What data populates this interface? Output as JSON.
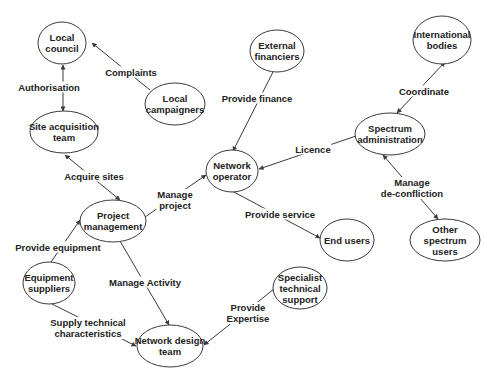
{
  "diagram": {
    "type": "stakeholder-relationship",
    "nodes": [
      {
        "id": "local_council",
        "label": "Local\ncouncil",
        "cx": 62,
        "cy": 43,
        "rx": 24,
        "ry": 21
      },
      {
        "id": "local_campaigners",
        "label": "Local\ncampaigners",
        "cx": 175,
        "cy": 104,
        "rx": 30,
        "ry": 21
      },
      {
        "id": "site_acquisition_team",
        "label": "Site acquisition\nteam",
        "cx": 64,
        "cy": 132,
        "rx": 34,
        "ry": 21
      },
      {
        "id": "external_financiers",
        "label": "External\nfinanciers",
        "cx": 277,
        "cy": 51,
        "rx": 27,
        "ry": 21
      },
      {
        "id": "international_bodies",
        "label": "International\nbodies",
        "cx": 442,
        "cy": 40,
        "rx": 29,
        "ry": 24
      },
      {
        "id": "spectrum_administration",
        "label": "Spectrum\nadministration",
        "cx": 390,
        "cy": 134,
        "rx": 35,
        "ry": 21
      },
      {
        "id": "network_operator",
        "label": "Network\noperator",
        "cx": 232,
        "cy": 171,
        "rx": 26,
        "ry": 21
      },
      {
        "id": "project_management",
        "label": "Project\nmanagement",
        "cx": 113,
        "cy": 221,
        "rx": 33,
        "ry": 21
      },
      {
        "id": "end_users",
        "label": "End users",
        "cx": 347,
        "cy": 240,
        "rx": 27,
        "ry": 21
      },
      {
        "id": "other_spectrum_users",
        "label": "Other spectrum\nusers",
        "cx": 445,
        "cy": 240,
        "rx": 35,
        "ry": 21
      },
      {
        "id": "equipment_suppliers",
        "label": "Equipment\nsuppliers",
        "cx": 49,
        "cy": 283,
        "rx": 26,
        "ry": 21
      },
      {
        "id": "specialist_technical_support",
        "label": "Specialist\ntechnical\nsupport",
        "cx": 300,
        "cy": 288,
        "rx": 27,
        "ry": 21
      },
      {
        "id": "network_design_team",
        "label": "Network design\nteam",
        "cx": 170,
        "cy": 346,
        "rx": 33,
        "ry": 21
      }
    ],
    "edges": [
      {
        "id": "complaints",
        "from": "local_campaigners",
        "to": "local_council",
        "label": "Complaints",
        "lx": 131,
        "ly": 72,
        "x1": 150,
        "y1": 90,
        "x2": 92,
        "y2": 43
      },
      {
        "id": "authorisation",
        "from": "local_council",
        "to": "site_acquisition_team",
        "label": "Authorisation",
        "lx": 49,
        "ly": 87,
        "x1": 63,
        "y1": 65,
        "x2": 63,
        "y2": 111,
        "bidirectional": true
      },
      {
        "id": "acquire_sites",
        "from": "project_management",
        "to": "site_acquisition_team",
        "label": "Acquire sites",
        "lx": 94,
        "ly": 176,
        "x1": 120,
        "y1": 200,
        "x2": 65,
        "y2": 155,
        "bidirectional": true
      },
      {
        "id": "manage_project",
        "from": "project_management",
        "to": "network_operator",
        "label": "Manage\nproject",
        "lx": 175,
        "ly": 200,
        "x1": 145,
        "y1": 217,
        "x2": 206,
        "y2": 175
      },
      {
        "id": "provide_finance",
        "from": "external_financiers",
        "to": "network_operator",
        "label": "Provide finance",
        "lx": 257,
        "ly": 98,
        "x1": 273,
        "y1": 72,
        "x2": 233,
        "y2": 151
      },
      {
        "id": "licence",
        "from": "spectrum_administration",
        "to": "network_operator",
        "label": "Licence",
        "lx": 313,
        "ly": 149,
        "x1": 356,
        "y1": 136,
        "x2": 259,
        "y2": 169
      },
      {
        "id": "coordinate",
        "from": "spectrum_administration",
        "to": "international_bodies",
        "label": "Coordinate",
        "lx": 424,
        "ly": 91,
        "x1": 397,
        "y1": 113,
        "x2": 445,
        "y2": 62,
        "bidirectional": true
      },
      {
        "id": "manage_deconfliction",
        "from": "spectrum_administration",
        "to": "other_spectrum_users",
        "label": "Manage\nde-confliction",
        "lx": 412,
        "ly": 188,
        "x1": 383,
        "y1": 155,
        "x2": 438,
        "y2": 219,
        "bidirectional": true
      },
      {
        "id": "provide_service",
        "from": "network_operator",
        "to": "end_users",
        "label": "Provide service",
        "lx": 280,
        "ly": 214,
        "x1": 232,
        "y1": 191,
        "x2": 320,
        "y2": 238
      },
      {
        "id": "provide_equipment",
        "from": "equipment_suppliers",
        "to": "project_management",
        "label": "Provide equipment",
        "lx": 58,
        "ly": 247,
        "x1": 51,
        "y1": 262,
        "x2": 80,
        "y2": 220
      },
      {
        "id": "manage_activity",
        "from": "project_management",
        "to": "network_design_team",
        "label": "Manage Activity",
        "lx": 145,
        "ly": 282,
        "x1": 120,
        "y1": 241,
        "x2": 169,
        "y2": 325
      },
      {
        "id": "supply_technical_characteristics",
        "from": "equipment_suppliers",
        "to": "network_design_team",
        "label": "Supply technical\ncharacteristics",
        "lx": 88,
        "ly": 328,
        "x1": 52,
        "y1": 304,
        "x2": 136,
        "y2": 346
      },
      {
        "id": "provide_expertise",
        "from": "specialist_technical_support",
        "to": "network_design_team",
        "label": "Provide\nExpertise",
        "lx": 248,
        "ly": 313,
        "x1": 274,
        "y1": 289,
        "x2": 204,
        "y2": 345
      }
    ]
  }
}
